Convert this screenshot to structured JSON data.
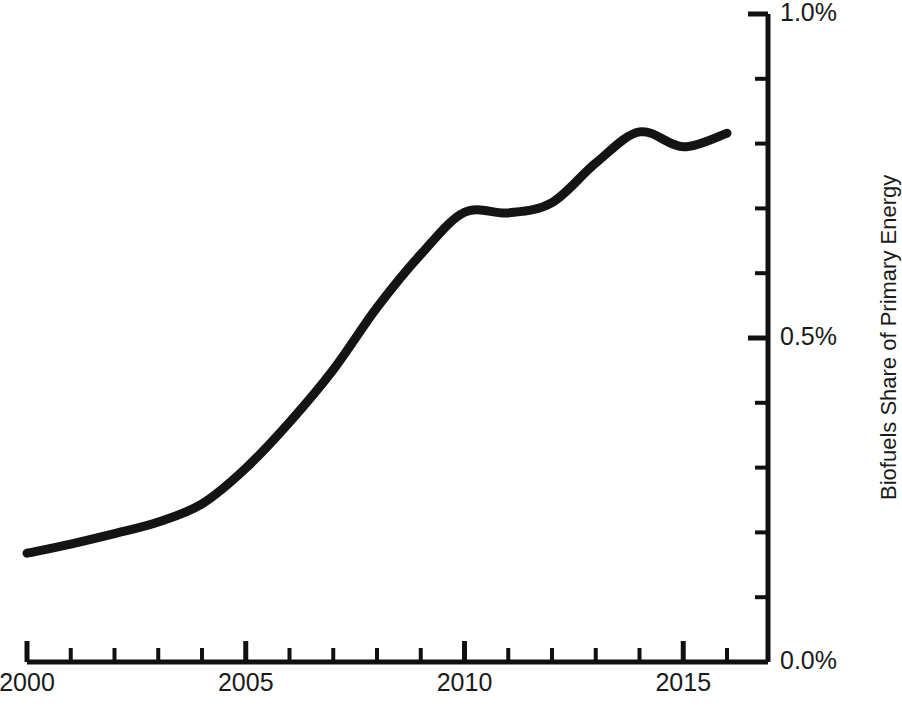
{
  "chart_data": {
    "type": "line",
    "title": "",
    "subtitle": "",
    "xlabel": "",
    "ylabel": "Biofuels Share of Primary Energy",
    "xlim": [
      2000,
      2016
    ],
    "ylim": [
      0.0,
      1.0
    ],
    "y_unit": "%",
    "grid": false,
    "legend": null,
    "x_major_ticks": [
      2000,
      2005,
      2010,
      2015
    ],
    "x_major_tick_labels": [
      "2000",
      "2005",
      "2010",
      "2015"
    ],
    "x_minor_tick_interval": 1,
    "y_major_ticks": [
      0.0,
      0.5,
      1.0
    ],
    "y_major_tick_labels": [
      "0.0%",
      "0.5%",
      "1.0%"
    ],
    "y_minor_tick_interval": 0.1,
    "y_axis_position": "right",
    "series": [
      {
        "name": "Biofuels Share of Primary Energy",
        "color": "#141414",
        "line_width": 9,
        "x": [
          2000,
          2001,
          2002,
          2003,
          2004,
          2005,
          2006,
          2007,
          2008,
          2009,
          2010,
          2011,
          2012,
          2013,
          2014,
          2015,
          2016
        ],
        "values": [
          0.168,
          0.182,
          0.198,
          0.216,
          0.244,
          0.299,
          0.37,
          0.451,
          0.547,
          0.629,
          0.694,
          0.693,
          0.709,
          0.77,
          0.818,
          0.795,
          0.816
        ]
      }
    ]
  },
  "axes": {
    "x_tick_labels": [
      {
        "text": "2000",
        "value": 2000
      },
      {
        "text": "2005",
        "value": 2005
      },
      {
        "text": "2010",
        "value": 2010
      },
      {
        "text": "2015",
        "value": 2015
      }
    ],
    "y_tick_labels": [
      {
        "text": "1.0%",
        "value": 1.0
      },
      {
        "text": "0.5%",
        "value": 0.5
      },
      {
        "text": "0.0%",
        "value": 0.0
      }
    ],
    "y_axis_title": "Biofuels Share of Primary Energy"
  },
  "style": {
    "background": "#ffffff",
    "axis_color": "#111111",
    "line_color": "#141414",
    "text_color": "#1a1a1a"
  }
}
